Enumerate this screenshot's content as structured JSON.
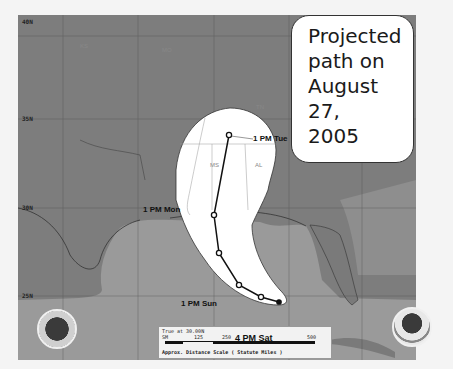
{
  "callout": {
    "lines": [
      "Projected",
      "path on",
      "August 27,",
      "2005"
    ]
  },
  "map": {
    "lat_labels": [
      "40N",
      "35N",
      "30N",
      "25N"
    ],
    "lon_labels": [
      "100W",
      "95W",
      "90W",
      "85W",
      "80W",
      "75W"
    ],
    "state_labels": [
      "KS",
      "MO",
      "OK",
      "TN",
      "MS",
      "AL",
      "LA"
    ],
    "time_labels": {
      "tue": "1 PM Tue",
      "mon": "1 PM Mon",
      "sun": "1 PM Sun",
      "sat": "4 PM Sat"
    },
    "colors": {
      "land": "#7d7d7d",
      "water": "#9a9a9a",
      "cone": "#ffffff",
      "track": "#111111"
    },
    "track_points": [
      {
        "x": 229,
        "y": 135
      },
      {
        "x": 214,
        "y": 215
      },
      {
        "x": 219,
        "y": 253
      },
      {
        "x": 239,
        "y": 285
      },
      {
        "x": 261,
        "y": 297
      },
      {
        "x": 279,
        "y": 302
      }
    ]
  },
  "scale": {
    "line1": "True at 30.00N",
    "ticks": [
      "SM",
      "125",
      "250",
      "500"
    ],
    "line3": "Approx. Distance Scale ( Statute Miles )"
  },
  "logos": {
    "left": "NWS seal",
    "right": "NOAA seal"
  }
}
